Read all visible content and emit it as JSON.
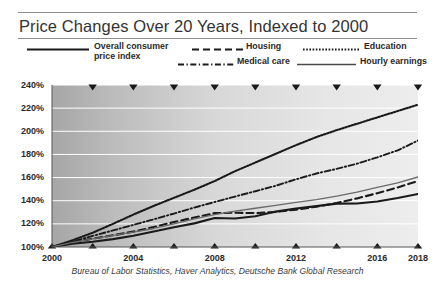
{
  "header": {
    "title": "Price Changes Over 20 Years, Indexed to 2000"
  },
  "legend": {
    "position": "top",
    "items": [
      {
        "label": "Overall consumer price index",
        "line_style": "solid",
        "color": "#1a1a1a",
        "width": 2.2
      },
      {
        "label": "Housing",
        "line_style": "dashed",
        "color": "#1a1a1a",
        "width": 2.2
      },
      {
        "label": "Education",
        "line_style": "dotted",
        "color": "#1a1a1a",
        "width": 2.0
      },
      {
        "label": "Medical care",
        "line_style": "dashdot",
        "color": "#1a1a1a",
        "width": 1.8
      },
      {
        "label": "Hourly earnings",
        "line_style": "solid",
        "color": "#6a6a6a",
        "width": 1.2
      }
    ]
  },
  "axes": {
    "y_ticks": [
      "100%",
      "120%",
      "140%",
      "160%",
      "180%",
      "200%",
      "220%",
      "240%"
    ],
    "x_ticks": [
      "2000",
      "2004",
      "2008",
      "2012",
      "2016",
      "2018"
    ],
    "marker_glyph": "triangle-down"
  },
  "source": {
    "text": "Bureau of Labor Statistics, Haver Analytics, Deutsche Bank Global Research"
  },
  "chart_data": {
    "type": "line",
    "title": "Price Changes Over 20 Years, Indexed to 2000",
    "xlabel": "",
    "ylabel": "",
    "xlim": [
      2000,
      2018
    ],
    "ylim": [
      100,
      240
    ],
    "y_tick_values": [
      100,
      120,
      140,
      160,
      180,
      200,
      220,
      240
    ],
    "y_tick_labels": [
      "100%",
      "120%",
      "140%",
      "160%",
      "180%",
      "200%",
      "220%",
      "240%"
    ],
    "x_tick_values": [
      2000,
      2004,
      2008,
      2012,
      2016,
      2018
    ],
    "x_tick_labels": [
      "2000",
      "2004",
      "2008",
      "2012",
      "2016",
      "2018"
    ],
    "x_minor_marker_values": [
      2000,
      2002,
      2004,
      2006,
      2008,
      2010,
      2012,
      2014,
      2016,
      2018
    ],
    "grid": "horizontal",
    "legend_position": "above-plot",
    "index_base_year": 2000,
    "index_base_value": 100,
    "x": [
      2000,
      2001,
      2002,
      2003,
      2004,
      2005,
      2006,
      2007,
      2008,
      2009,
      2010,
      2011,
      2012,
      2013,
      2014,
      2015,
      2016,
      2017,
      2018
    ],
    "series": [
      {
        "name": "Overall consumer price index",
        "line_style": "solid",
        "color": "#1a1a1a",
        "values": [
          100,
          102.8,
          104.5,
          106.8,
          109.7,
          113.4,
          117.1,
          120.4,
          125.0,
          124.6,
          126.6,
          130.6,
          133.3,
          135.3,
          137.5,
          137.6,
          139.3,
          142.3,
          145.8
        ]
      },
      {
        "name": "Housing",
        "line_style": "dashed",
        "color": "#1a1a1a",
        "values": [
          100,
          104.1,
          107.2,
          110.1,
          113.3,
          117.2,
          121.6,
          125.5,
          129.3,
          129.6,
          129.3,
          130.3,
          132.3,
          134.8,
          138.1,
          142.0,
          146.5,
          151.5,
          157.0
        ]
      },
      {
        "name": "Education",
        "line_style": "dotted",
        "color": "#1a1a1a",
        "values": [
          100,
          105.8,
          112.3,
          120.0,
          128.0,
          135.5,
          142.5,
          149.5,
          157.0,
          165.5,
          173.0,
          180.5,
          188.0,
          195.0,
          201.0,
          206.5,
          212.0,
          217.5,
          223.0
        ]
      },
      {
        "name": "Medical care",
        "line_style": "dashdot",
        "color": "#1a1a1a",
        "values": [
          100,
          104.6,
          109.6,
          114.3,
          119.1,
          123.9,
          128.9,
          134.1,
          138.9,
          143.6,
          148.2,
          152.9,
          158.5,
          163.5,
          167.5,
          172.0,
          177.5,
          183.5,
          192.0
        ]
      },
      {
        "name": "Hourly earnings",
        "line_style": "solid",
        "color": "#6a6a6a",
        "values": [
          100,
          103.9,
          107.1,
          110.1,
          112.9,
          116.0,
          120.0,
          124.3,
          128.0,
          131.0,
          133.5,
          136.0,
          138.5,
          141.0,
          144.0,
          147.5,
          151.5,
          155.5,
          160.5
        ]
      }
    ]
  },
  "colors": {
    "plot_background_left": "#a8a8a8",
    "plot_background_right": "#ebebeb",
    "gridline": "#ffffff",
    "rule": "#8e8e8e",
    "text": "#2a2a2a"
  }
}
